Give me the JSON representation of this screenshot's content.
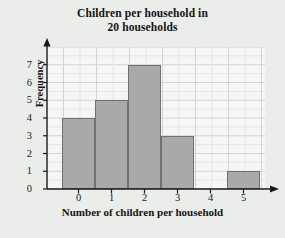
{
  "chart_data": {
    "type": "bar",
    "title": "Children per household in 20 households",
    "title_line1": "Children per household in",
    "title_line2": "20 households",
    "xlabel": "Number of children per household",
    "ylabel": "Frequency",
    "categories": [
      "0",
      "1",
      "2",
      "3",
      "4",
      "5"
    ],
    "values": [
      4,
      5,
      7,
      3,
      0,
      1
    ],
    "ylim": [
      0,
      8
    ],
    "yticks": [
      "0",
      "1",
      "2",
      "3",
      "4",
      "5",
      "6",
      "7"
    ],
    "xticks": [
      "0",
      "1",
      "2",
      "3",
      "4",
      "5"
    ],
    "grid": true,
    "minor_grid": true,
    "legend": "none",
    "total": 20
  },
  "style": {
    "page_background": "#ebedeb",
    "plot_background": "#f5f6f5",
    "bar_fill": "#a9a9a9",
    "bar_border": "#707070",
    "gridline_major": "#d2d4d2",
    "gridline_minor": "#e4e6e4",
    "axis_color": "#1a1a1a",
    "text_color": "#141414"
  }
}
